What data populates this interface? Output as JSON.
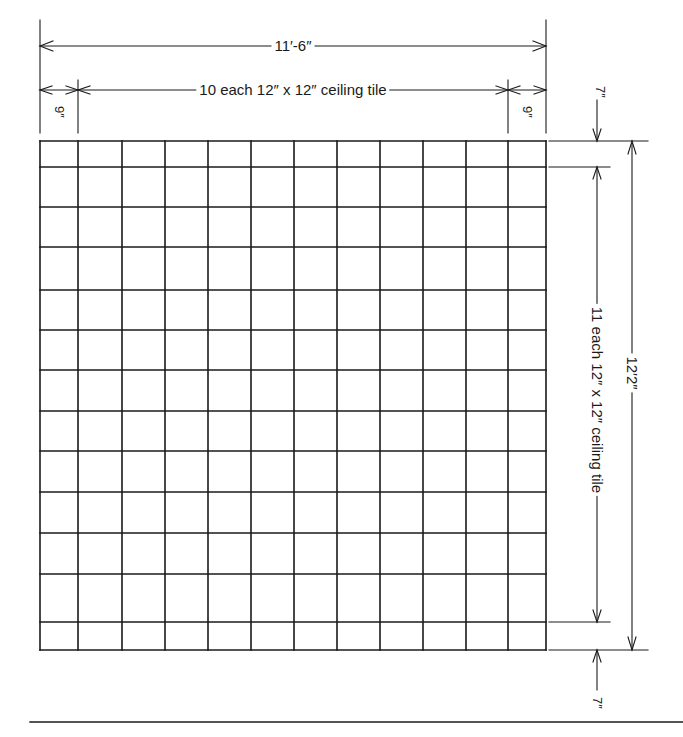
{
  "colors": {
    "line": "#1a1a1a",
    "background": "#ffffff"
  },
  "dimensions": {
    "overall_width": "11′-6″",
    "overall_height": "12′2″",
    "tiles_across": "10 each 12″ x 12″ ceiling tile",
    "tiles_down": "11 each 12″ x 12″ ceiling tile",
    "left_border": "9″",
    "right_border": "9″",
    "top_border": "7″",
    "bottom_border": "7″"
  },
  "grid": {
    "columns_full_tiles": 10,
    "rows_full_tiles": 11,
    "column_lines_px": [
      40,
      78,
      122,
      165,
      208,
      251,
      294,
      337,
      380,
      423,
      466,
      508,
      546
    ],
    "row_lines_px": [
      141,
      167,
      207,
      247,
      290,
      330,
      370,
      411,
      451,
      492,
      533,
      574,
      622,
      650
    ]
  }
}
